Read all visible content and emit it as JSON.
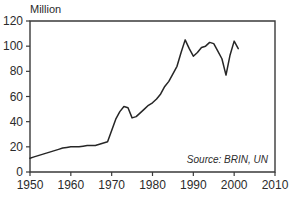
{
  "chart_data": {
    "type": "line",
    "title": "",
    "subtitle": "",
    "ylabel": "Million",
    "xlabel": "",
    "xlim": [
      1950,
      2010
    ],
    "ylim": [
      0,
      120
    ],
    "grid": false,
    "legend": false,
    "annotation": "Source: BRIN, UN",
    "xticks": [
      1950,
      1960,
      1970,
      1980,
      1990,
      2000,
      2010
    ],
    "xtick_labels": [
      "1950",
      "1960",
      "1970",
      "1980",
      "1990",
      "2000",
      "2010"
    ],
    "yticks": [
      0,
      20,
      40,
      60,
      80,
      100,
      120
    ],
    "ytick_labels": [
      "0",
      "20",
      "40",
      "60",
      "80",
      "100",
      "120"
    ],
    "series": [
      {
        "name": "Value",
        "color": "#262626",
        "x": [
          1950,
          1951,
          1952,
          1953,
          1954,
          1955,
          1956,
          1957,
          1958,
          1959,
          1960,
          1961,
          1962,
          1963,
          1964,
          1965,
          1966,
          1967,
          1968,
          1969,
          1970,
          1971,
          1972,
          1973,
          1974,
          1975,
          1976,
          1977,
          1978,
          1979,
          1980,
          1981,
          1982,
          1983,
          1984,
          1985,
          1986,
          1987,
          1988,
          1989,
          1990,
          1991,
          1992,
          1993,
          1994,
          1995,
          1996,
          1997,
          1998,
          1999,
          2000,
          2001
        ],
        "y": [
          11,
          12,
          13,
          14,
          15,
          16,
          17,
          18,
          19,
          19.5,
          20,
          20,
          20,
          20.5,
          21,
          21,
          21,
          22,
          23,
          24,
          33,
          42,
          48,
          52,
          51,
          43,
          44,
          47,
          50,
          53,
          55,
          58,
          62,
          68,
          72,
          78,
          84,
          95,
          105,
          98,
          92,
          95,
          99,
          100,
          103,
          102,
          96,
          90,
          77,
          93,
          104,
          98
        ]
      }
    ]
  },
  "axis": {
    "y_label": "Million"
  },
  "annotation": {
    "source": "Source: BRIN, UN"
  }
}
